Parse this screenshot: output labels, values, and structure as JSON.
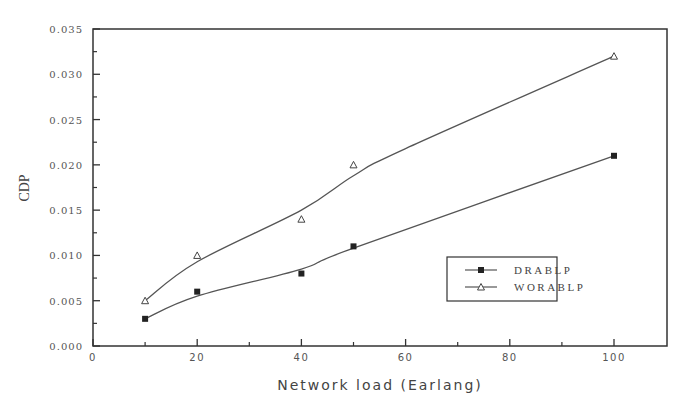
{
  "chart_data": {
    "type": "line",
    "title": "",
    "xlabel": "Network load (Earlang)",
    "ylabel": "CDP",
    "xlim": [
      0,
      110
    ],
    "ylim": [
      0,
      0.035
    ],
    "xticks": [
      0,
      20,
      40,
      60,
      80,
      100
    ],
    "xtick_labels": [
      "0",
      "20",
      "40",
      "60",
      "80",
      "100"
    ],
    "yticks": [
      0.0,
      0.005,
      0.01,
      0.015,
      0.02,
      0.025,
      0.03,
      0.035
    ],
    "ytick_labels": [
      "0.000",
      "0.005",
      "0.010",
      "0.015",
      "0.020",
      "0.025",
      "0.030",
      "0.035"
    ],
    "grid": false,
    "legend_position": "lower-right",
    "series": [
      {
        "name": "DRABLP",
        "marker": "square",
        "x": [
          10,
          20,
          40,
          50,
          100
        ],
        "values": [
          0.003,
          0.006,
          0.008,
          0.011,
          0.021
        ]
      },
      {
        "name": "WORABLP",
        "marker": "triangle",
        "x": [
          10,
          20,
          40,
          50,
          100
        ],
        "values": [
          0.005,
          0.01,
          0.014,
          0.02,
          0.032
        ]
      }
    ]
  },
  "colors": {
    "line": "#555555",
    "frame": "#333333",
    "text": "#555555"
  }
}
